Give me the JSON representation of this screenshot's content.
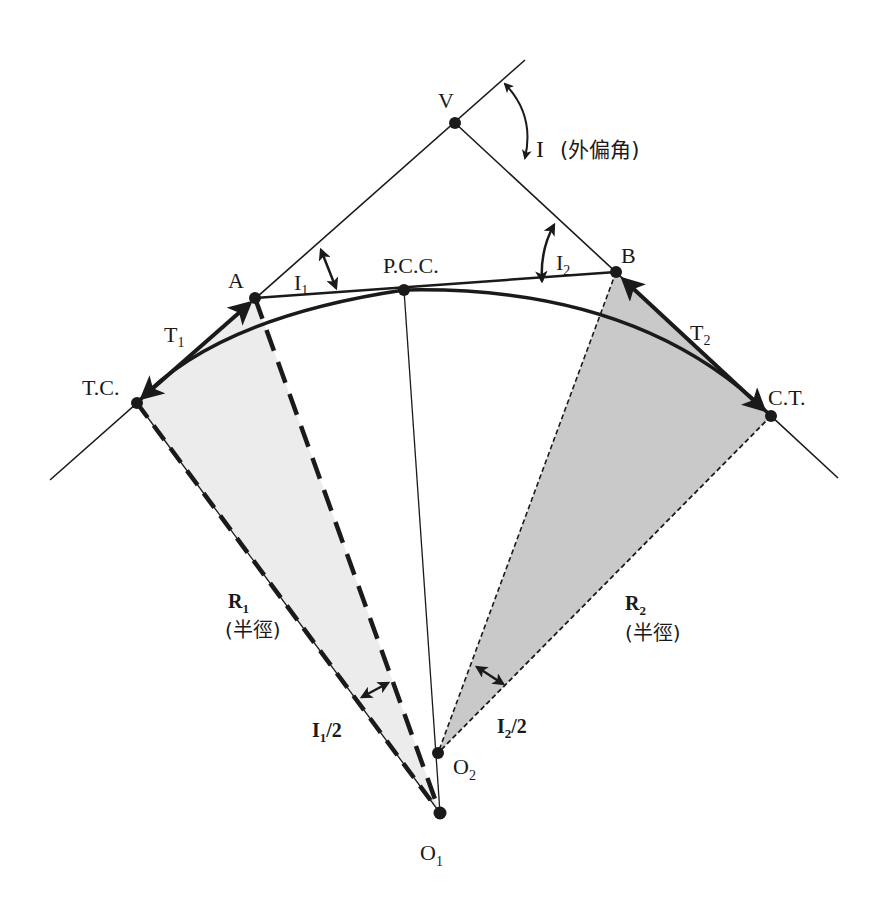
{
  "diagram": {
    "type": "compound-circular-curve",
    "colors": {
      "line": "#1a1a1a",
      "fill_left": "#ececec",
      "fill_right": "#c9c9c9",
      "background": "#ffffff"
    },
    "points": {
      "V": {
        "label": "V",
        "x": 455,
        "y": 123
      },
      "A": {
        "label": "A",
        "x": 255,
        "y": 298
      },
      "B": {
        "label": "B",
        "x": 616,
        "y": 272
      },
      "PCC": {
        "label": "P.C.C.",
        "x": 404,
        "y": 290
      },
      "TC": {
        "label": "T.C.",
        "x": 137,
        "y": 403
      },
      "CT": {
        "label": "C.T.",
        "x": 771,
        "y": 416
      },
      "O1": {
        "label": "O",
        "sub": "1",
        "x": 440,
        "y": 813
      },
      "O2": {
        "label": "O",
        "sub": "2",
        "x": 438,
        "y": 753
      }
    },
    "labels": {
      "I": "I",
      "I_note": "(外偏角)",
      "I1": {
        "main": "I",
        "sub": "1"
      },
      "I2": {
        "main": "I",
        "sub": "2"
      },
      "T1": {
        "main": "T",
        "sub": "1"
      },
      "T2": {
        "main": "T",
        "sub": "2"
      },
      "R1": {
        "main": "R",
        "sub": "1",
        "note": "(半徑)"
      },
      "R2": {
        "main": "R",
        "sub": "2",
        "note": "(半徑)"
      },
      "I1_half": {
        "main": "I",
        "sub": "1",
        "suffix": "/2"
      },
      "I2_half": {
        "main": "I",
        "sub": "2",
        "suffix": "/2"
      }
    }
  }
}
